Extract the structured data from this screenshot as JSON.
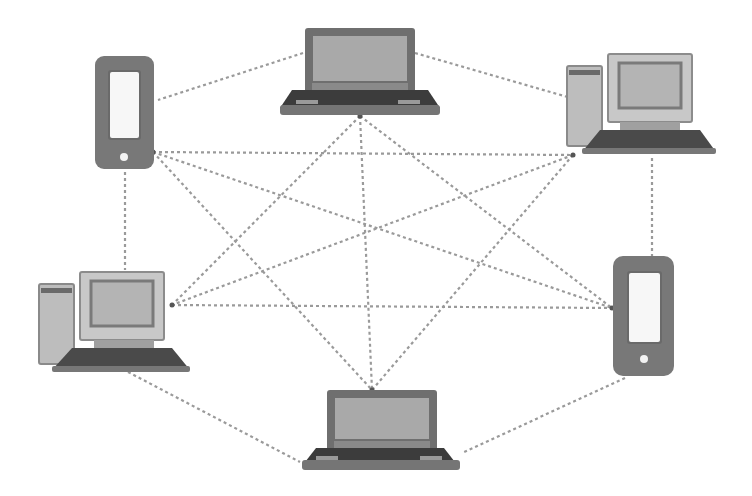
{
  "diagram": {
    "title": "Peer-to-peer mesh network",
    "colors": {
      "background": "#ffffff",
      "link": "#9a9a9a",
      "device_dark": "#6b6b6b",
      "device_mid": "#8e8e8e",
      "device_screen": "#b0b0b0",
      "device_light": "#d6d6d6",
      "keyboard": "#3e3e3e"
    },
    "nodes": [
      {
        "id": "laptop-top",
        "type": "laptop",
        "label": "Laptop (top)"
      },
      {
        "id": "phone-top-left",
        "type": "smartphone",
        "label": "Smartphone (top left)"
      },
      {
        "id": "desktop-top-right",
        "type": "desktop",
        "label": "Desktop (top right)"
      },
      {
        "id": "desktop-bottom-left",
        "type": "desktop",
        "label": "Desktop (bottom left)"
      },
      {
        "id": "phone-right",
        "type": "smartphone",
        "label": "Smartphone (right)"
      },
      {
        "id": "laptop-bottom",
        "type": "laptop",
        "label": "Laptop (bottom)"
      }
    ],
    "link_style": "dotted",
    "links": [
      [
        "laptop-top",
        "phone-top-left"
      ],
      [
        "laptop-top",
        "desktop-top-right"
      ],
      [
        "laptop-top",
        "desktop-bottom-left"
      ],
      [
        "laptop-top",
        "phone-right"
      ],
      [
        "laptop-top",
        "laptop-bottom"
      ],
      [
        "phone-top-left",
        "desktop-top-right"
      ],
      [
        "phone-top-left",
        "desktop-bottom-left"
      ],
      [
        "phone-top-left",
        "phone-right"
      ],
      [
        "phone-top-left",
        "laptop-bottom"
      ],
      [
        "desktop-top-right",
        "desktop-bottom-left"
      ],
      [
        "desktop-top-right",
        "phone-right"
      ],
      [
        "desktop-top-right",
        "laptop-bottom"
      ],
      [
        "desktop-bottom-left",
        "phone-right"
      ],
      [
        "desktop-bottom-left",
        "laptop-bottom"
      ],
      [
        "phone-right",
        "laptop-bottom"
      ]
    ]
  }
}
